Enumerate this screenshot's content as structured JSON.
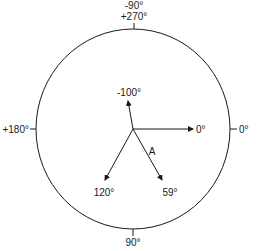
{
  "diagram": {
    "type": "phasor-circle",
    "circle": {
      "cx": 133,
      "cy": 129,
      "r": 98
    },
    "origin": {
      "x": 133,
      "y": 129
    },
    "boundary_labels": {
      "top_line1": "-90°",
      "top_line2": "+270°",
      "left": "+180°",
      "right": "0°",
      "bottom": "90°"
    },
    "vectors": [
      {
        "label": "0°",
        "angle_deg": 0,
        "tip": {
          "x": 193,
          "y": 129
        }
      },
      {
        "label": "-100°",
        "angle_deg": -100,
        "tip": {
          "x": 128,
          "y": 101
        }
      },
      {
        "label": "120°",
        "angle_deg": 120,
        "tip": {
          "x": 105,
          "y": 180
        }
      },
      {
        "label": "59°",
        "angle_deg": 59,
        "tip": {
          "x": 162,
          "y": 180
        }
      }
    ],
    "annotation": "A",
    "stroke_color": "#1a1a1a"
  }
}
